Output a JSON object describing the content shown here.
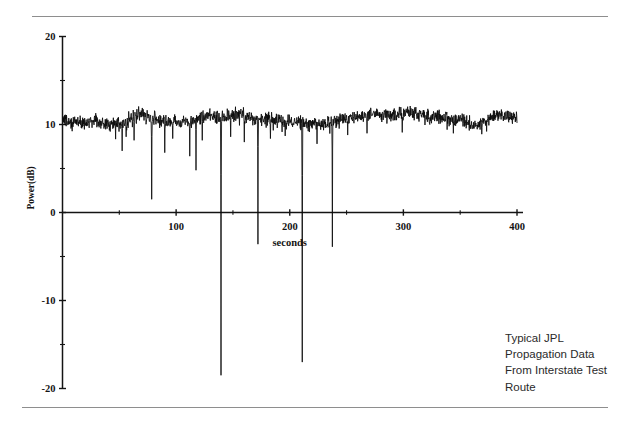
{
  "caption": {
    "lines": [
      "Typical JPL",
      "Propagation Data",
      "From Interstate Test",
      "Route"
    ]
  },
  "chart_data": {
    "type": "line",
    "title": "",
    "xlabel": "seconds",
    "ylabel": "Power(dB)",
    "xlim": [
      0,
      400
    ],
    "ylim": [
      -20,
      20
    ],
    "grid": false,
    "legend": "none",
    "xticks": [
      0,
      50,
      100,
      150,
      200,
      250,
      300,
      350,
      400
    ],
    "xtick_labels": [
      "",
      "",
      "100",
      "",
      "200",
      "",
      "300",
      "",
      "400"
    ],
    "yticks": [
      -20,
      -15,
      -10,
      -5,
      0,
      5,
      10,
      15,
      20
    ],
    "ytick_labels": [
      "-20",
      "",
      "-10",
      "",
      "0",
      "",
      "10",
      "",
      "20"
    ],
    "series": [
      {
        "name": "Received Power",
        "description": "Noisy received signal power near 10.5 dB with intermittent deep fades (blockage events) dropping as low as -18.5 dB",
        "baseline_mean_db": 10.5,
        "noise_peak_to_peak_db": 1.6,
        "sample_interval_seconds": 0.25,
        "baseline_envelope_x": [
          0,
          20,
          35,
          45,
          55,
          68,
          80,
          95,
          110,
          125,
          140,
          155,
          170,
          185,
          200,
          215,
          230,
          245,
          260,
          275,
          290,
          305,
          320,
          335,
          350,
          362,
          372,
          382,
          392
        ],
        "baseline_envelope_y": [
          10.4,
          10.3,
          10.2,
          10.1,
          10.3,
          11.3,
          10.6,
          10.3,
          10.4,
          11.0,
          10.8,
          11.2,
          10.6,
          10.5,
          10.3,
          10.2,
          10.1,
          10.6,
          11.0,
          11.2,
          11.1,
          11.3,
          11.0,
          10.7,
          10.6,
          9.8,
          10.2,
          11.2,
          10.8
        ],
        "fades": [
          {
            "x": 52.5,
            "depth_db": 7.0
          },
          {
            "x": 56.0,
            "depth_db": 8.6
          },
          {
            "x": 63.0,
            "depth_db": 8.2
          },
          {
            "x": 78.5,
            "depth_db": 1.5
          },
          {
            "x": 90.0,
            "depth_db": 6.8
          },
          {
            "x": 97.0,
            "depth_db": 8.4
          },
          {
            "x": 112.0,
            "depth_db": 6.4
          },
          {
            "x": 117.5,
            "depth_db": 4.8
          },
          {
            "x": 123.0,
            "depth_db": 8.2
          },
          {
            "x": 139.5,
            "depth_db": -18.5
          },
          {
            "x": 148.0,
            "depth_db": 8.6
          },
          {
            "x": 160.0,
            "depth_db": 8.0
          },
          {
            "x": 172.0,
            "depth_db": -3.6
          },
          {
            "x": 183.0,
            "depth_db": 8.4
          },
          {
            "x": 196.0,
            "depth_db": 8.7
          },
          {
            "x": 211.0,
            "depth_db": -17.0
          },
          {
            "x": 224.0,
            "depth_db": 7.8
          },
          {
            "x": 237.5,
            "depth_db": -3.9
          },
          {
            "x": 251.0,
            "depth_db": 8.8
          },
          {
            "x": 268.0,
            "depth_db": 9.0
          },
          {
            "x": 299.0,
            "depth_db": 9.1
          },
          {
            "x": 344.0,
            "depth_db": 9.0
          },
          {
            "x": 369.0,
            "depth_db": 8.9
          }
        ]
      }
    ]
  }
}
